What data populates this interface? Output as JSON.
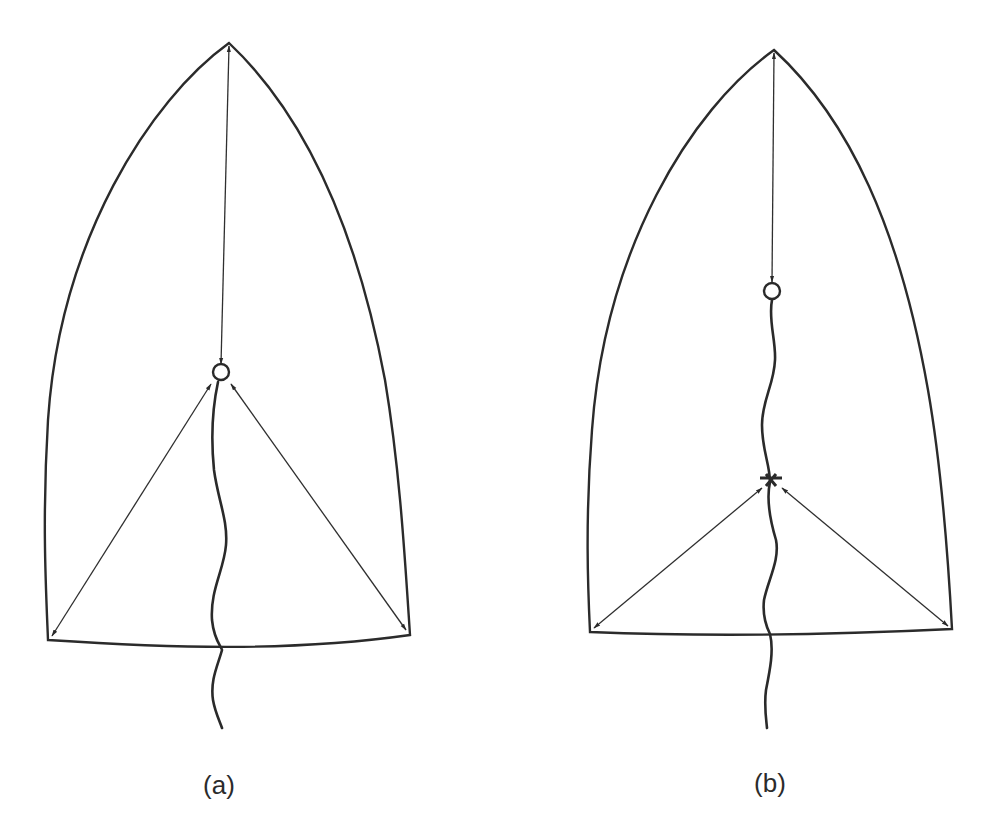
{
  "figure": {
    "panels": [
      {
        "id": "a",
        "label": "(a)",
        "description": "Sail outline with three tension arrows meeting at a ring; a wavy line hangs from the ring down through the foot",
        "label_position": {
          "x": 219,
          "y": 788
        }
      },
      {
        "id": "b",
        "label": "(b)",
        "description": "Sail outline with head arrow ending at a ring; wavy line from ring to a lower junction point where two corner arrows meet, continuing down through the foot",
        "label_position": {
          "x": 770,
          "y": 786
        }
      }
    ],
    "colors": {
      "background": "#ffffff",
      "stroke": "#2b2b2b"
    }
  }
}
